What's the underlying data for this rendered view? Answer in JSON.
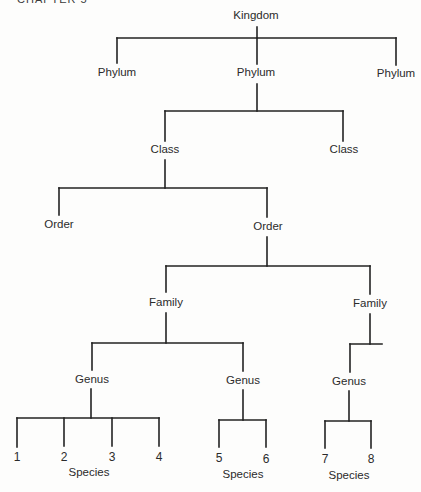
{
  "header": {
    "chapter": "CHAPTER 5"
  },
  "diagram": {
    "line_color": "#222222",
    "background": "#fdfdfc",
    "nodes": [
      {
        "id": "kingdom",
        "label": "Kingdom",
        "x": 256,
        "y": 16
      },
      {
        "id": "phylum-left",
        "label": "Phylum",
        "x": 117,
        "y": 73
      },
      {
        "id": "phylum-center",
        "label": "Phylum",
        "x": 256,
        "y": 73
      },
      {
        "id": "phylum-right",
        "label": "Phylum",
        "x": 396,
        "y": 74
      },
      {
        "id": "class-left",
        "label": "Class",
        "x": 165,
        "y": 150
      },
      {
        "id": "class-right",
        "label": "Class",
        "x": 344,
        "y": 150
      },
      {
        "id": "order-left",
        "label": "Order",
        "x": 59,
        "y": 225
      },
      {
        "id": "order-right",
        "label": "Order",
        "x": 268,
        "y": 227
      },
      {
        "id": "family-left",
        "label": "Family",
        "x": 166,
        "y": 303
      },
      {
        "id": "family-right",
        "label": "Family",
        "x": 370,
        "y": 304
      },
      {
        "id": "genus-1",
        "label": "Genus",
        "x": 92,
        "y": 380
      },
      {
        "id": "genus-2",
        "label": "Genus",
        "x": 243,
        "y": 381
      },
      {
        "id": "genus-3",
        "label": "Genus",
        "x": 349,
        "y": 382
      },
      {
        "id": "species-1",
        "label": "1",
        "x": 17,
        "y": 457,
        "num": true
      },
      {
        "id": "species-2",
        "label": "2",
        "x": 64,
        "y": 457,
        "num": true
      },
      {
        "id": "species-3",
        "label": "3",
        "x": 112,
        "y": 457,
        "num": true
      },
      {
        "id": "species-4",
        "label": "4",
        "x": 159,
        "y": 457,
        "num": true
      },
      {
        "id": "species-5",
        "label": "5",
        "x": 219,
        "y": 458,
        "num": true
      },
      {
        "id": "species-6",
        "label": "6",
        "x": 266,
        "y": 459,
        "num": true
      },
      {
        "id": "species-7",
        "label": "7",
        "x": 325,
        "y": 459,
        "num": true
      },
      {
        "id": "species-8",
        "label": "8",
        "x": 371,
        "y": 459,
        "num": true
      },
      {
        "id": "species-label-1",
        "label": "Species",
        "x": 89,
        "y": 473
      },
      {
        "id": "species-label-2",
        "label": "Species",
        "x": 243,
        "y": 475
      },
      {
        "id": "species-label-3",
        "label": "Species",
        "x": 349,
        "y": 476
      }
    ],
    "lines": [
      [
        257,
        27,
        257,
        38
      ],
      [
        117,
        38,
        396,
        38
      ],
      [
        117,
        38,
        117,
        63
      ],
      [
        257,
        38,
        257,
        64
      ],
      [
        396,
        38,
        396,
        65
      ],
      [
        257,
        84,
        257,
        111
      ],
      [
        165,
        111,
        343,
        111
      ],
      [
        165,
        111,
        165,
        141
      ],
      [
        343,
        111,
        343,
        141
      ],
      [
        165,
        160,
        165,
        188
      ],
      [
        59,
        188,
        267,
        188
      ],
      [
        59,
        188,
        59,
        215
      ],
      [
        267,
        188,
        267,
        217
      ],
      [
        267,
        237,
        267,
        266
      ],
      [
        166,
        266,
        370,
        266
      ],
      [
        166,
        266,
        166,
        292
      ],
      [
        370,
        266,
        370,
        294
      ],
      [
        166,
        313,
        166,
        343
      ],
      [
        92,
        343,
        243,
        343
      ],
      [
        92,
        343,
        92,
        370
      ],
      [
        243,
        343,
        243,
        371
      ],
      [
        370,
        314,
        370,
        344
      ],
      [
        350,
        344,
        382,
        344
      ],
      [
        350,
        344,
        350,
        372
      ],
      [
        91,
        389,
        91,
        418
      ],
      [
        17,
        418,
        159,
        418
      ],
      [
        17,
        418,
        17,
        447
      ],
      [
        64,
        418,
        64,
        446
      ],
      [
        112,
        418,
        112,
        446
      ],
      [
        159,
        418,
        159,
        446
      ],
      [
        243,
        390,
        243,
        420
      ],
      [
        219,
        420,
        266,
        420
      ],
      [
        219,
        420,
        219,
        447
      ],
      [
        266,
        420,
        266,
        447
      ],
      [
        349,
        391,
        349,
        421
      ],
      [
        325,
        421,
        371,
        421
      ],
      [
        325,
        421,
        325,
        448
      ],
      [
        371,
        421,
        371,
        448
      ]
    ]
  }
}
